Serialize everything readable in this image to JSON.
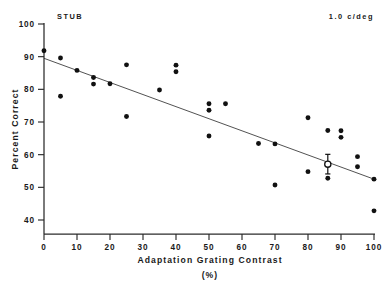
{
  "figure": {
    "subject_label": "STUB",
    "condition_label": "1.0 c/deg"
  },
  "chart_data": {
    "type": "scatter",
    "title": "",
    "xlabel": "Adaptation Grating Contrast",
    "xlabel_units": "(%)",
    "ylabel": "Percent Correct",
    "xlim": [
      0,
      100
    ],
    "ylim": [
      36,
      100
    ],
    "grid": false,
    "legend": "none",
    "xticks": [
      0,
      10,
      20,
      30,
      40,
      50,
      60,
      70,
      80,
      90,
      100
    ],
    "xtick_labels": [
      "0",
      "10",
      "20",
      "30",
      "40",
      "50",
      "60",
      "70",
      "80",
      "90",
      "100"
    ],
    "yticks": [
      40,
      50,
      60,
      70,
      80,
      90,
      100
    ],
    "ytick_labels": [
      "40",
      "50",
      "60",
      "70",
      "80",
      "90",
      "100"
    ],
    "annotations": [
      {
        "text": "STUB",
        "x": 5,
        "y": 102,
        "name": "subject-annotation"
      },
      {
        "text": "1.0 c/deg",
        "x": 88,
        "y": 102,
        "name": "spatial-frequency-annotation"
      }
    ],
    "series": [
      {
        "name": "Individual sessions",
        "marker": "filled-circle",
        "color": "#111111",
        "points": [
          {
            "x": 0,
            "y": 91.8
          },
          {
            "x": 5,
            "y": 89.6
          },
          {
            "x": 5,
            "y": 77.9
          },
          {
            "x": 10,
            "y": 85.8
          },
          {
            "x": 15,
            "y": 83.6
          },
          {
            "x": 15,
            "y": 81.6
          },
          {
            "x": 20,
            "y": 81.7
          },
          {
            "x": 25,
            "y": 87.5
          },
          {
            "x": 25,
            "y": 71.7
          },
          {
            "x": 35,
            "y": 79.8
          },
          {
            "x": 40,
            "y": 87.4
          },
          {
            "x": 40,
            "y": 85.4
          },
          {
            "x": 50,
            "y": 75.6
          },
          {
            "x": 50,
            "y": 73.6
          },
          {
            "x": 50,
            "y": 65.7
          },
          {
            "x": 55,
            "y": 75.6
          },
          {
            "x": 65,
            "y": 63.4
          },
          {
            "x": 70,
            "y": 63.3
          },
          {
            "x": 70,
            "y": 50.7
          },
          {
            "x": 80,
            "y": 71.3
          },
          {
            "x": 80,
            "y": 54.8
          },
          {
            "x": 86,
            "y": 67.4
          },
          {
            "x": 86,
            "y": 52.8
          },
          {
            "x": 90,
            "y": 67.3
          },
          {
            "x": 90,
            "y": 65.3
          },
          {
            "x": 95,
            "y": 59.4
          },
          {
            "x": 95,
            "y": 56.3
          },
          {
            "x": 100,
            "y": 52.5
          },
          {
            "x": 100,
            "y": 42.8
          }
        ]
      },
      {
        "name": "Mean with standard error",
        "marker": "open-circle-with-errorbars",
        "color": "#111111",
        "points": [
          {
            "x": 86,
            "y": 57.1,
            "yerr_low": 3.0,
            "yerr_high": 3.0
          }
        ]
      }
    ],
    "fit_line": {
      "name": "Linear regression",
      "x_start": 0,
      "y_start": 89.5,
      "x_end": 100,
      "y_end": 52.5,
      "slope": -0.37,
      "intercept": 89.5
    }
  }
}
